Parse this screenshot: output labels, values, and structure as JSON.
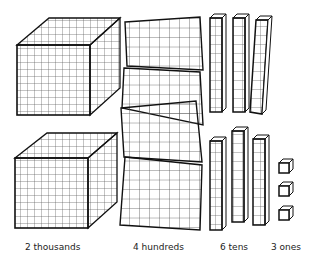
{
  "groups": [
    {
      "id": "thousands",
      "count": 2,
      "label": "2 thousands",
      "block": "thousand-cube"
    },
    {
      "id": "hundreds",
      "count": 4,
      "label": "4 hundreds",
      "block": "hundred-flat"
    },
    {
      "id": "tens",
      "count": 6,
      "label": "6 tens",
      "block": "ten-rod"
    },
    {
      "id": "ones",
      "count": 3,
      "label": "3 ones",
      "block": "unit-cube"
    }
  ],
  "colors": {
    "line": "#111111",
    "grid": "#444444",
    "background": "#ffffff"
  }
}
